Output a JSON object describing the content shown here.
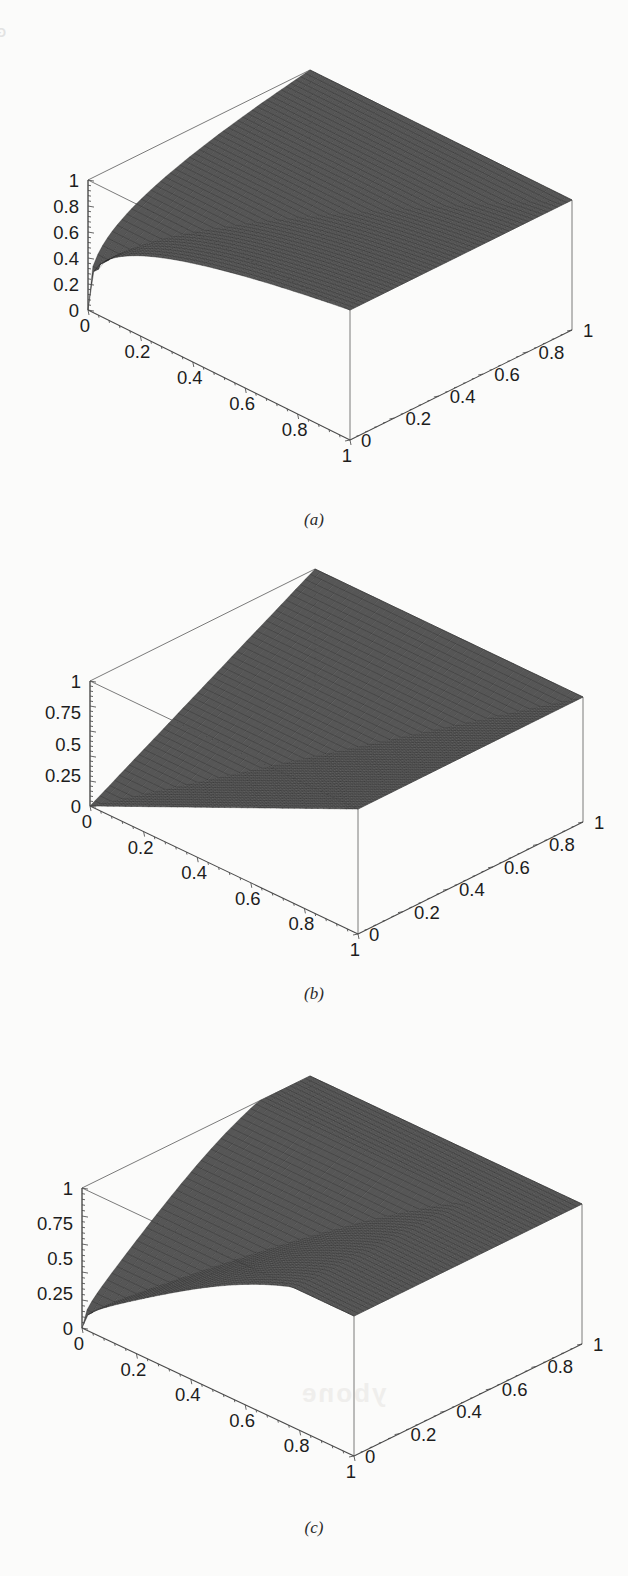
{
  "page": {
    "background_color": "#fbfbfa",
    "bleed_through_header": "GENERALIZED SHANNON ENTR",
    "bleed_through_fragment_mid": "ybone",
    "bleed_through_fragment_low": "ybone"
  },
  "figures": [
    {
      "id": "a",
      "caption": "(a)",
      "zaxis": {
        "label": "",
        "ticks": [
          "1",
          "0.8",
          "0.6",
          "0.4",
          "0.2",
          "0"
        ],
        "range": [
          0,
          1
        ]
      },
      "xaxis": {
        "label": "",
        "ticks": [
          "0",
          "0.2",
          "0.4",
          "0.6",
          "0.8",
          "1"
        ],
        "range": [
          0,
          1
        ]
      },
      "yaxis": {
        "label": "",
        "ticks": [
          "0",
          "0.2",
          "0.4",
          "0.6",
          "0.8",
          "1"
        ],
        "range": [
          0,
          1
        ]
      }
    },
    {
      "id": "b",
      "caption": "(b)",
      "zaxis": {
        "label": "",
        "ticks": [
          "1",
          "0.75",
          "0.5",
          "0.25",
          "0"
        ],
        "range": [
          0,
          1
        ]
      },
      "xaxis": {
        "label": "",
        "ticks": [
          "0",
          "0.2",
          "0.4",
          "0.6",
          "0.8",
          "1"
        ],
        "range": [
          0,
          1
        ]
      },
      "yaxis": {
        "label": "",
        "ticks": [
          "0",
          "0.2",
          "0.4",
          "0.6",
          "0.8",
          "1"
        ],
        "range": [
          0,
          1
        ]
      }
    },
    {
      "id": "c",
      "caption": "(c)",
      "zaxis": {
        "label": "",
        "ticks": [
          "1",
          "0.75",
          "0.5",
          "0.25",
          "0"
        ],
        "range": [
          0,
          1
        ]
      },
      "xaxis": {
        "label": "",
        "ticks": [
          "0",
          "0.2",
          "0.4",
          "0.6",
          "0.8",
          "1"
        ],
        "range": [
          0,
          1
        ]
      },
      "yaxis": {
        "label": "",
        "ticks": [
          "0",
          "0.2",
          "0.4",
          "0.6",
          "0.8",
          "1"
        ],
        "range": [
          0,
          1
        ]
      }
    }
  ],
  "chart_data": [
    {
      "type": "surface",
      "id": "a",
      "title": "",
      "xlabel": "",
      "ylabel": "",
      "zlabel": "",
      "xlim": [
        0,
        1
      ],
      "ylim": [
        0,
        1
      ],
      "zlim": [
        0,
        1
      ],
      "xticks": [
        0,
        0.2,
        0.4,
        0.6,
        0.8,
        1
      ],
      "yticks": [
        0,
        0.2,
        0.4,
        0.6,
        0.8,
        1
      ],
      "zticks": [
        0,
        0.2,
        0.4,
        0.6,
        0.8,
        1
      ],
      "grid": true,
      "legend": "none",
      "surface_formula": "z = max(x,y) ^ 0.25 style saturating ridge; high plateau near 1 over most of domain, dipping to 0 at the front corner (x=1,y=0)",
      "x": [
        0,
        0.25,
        0.5,
        0.75,
        1
      ],
      "y": [
        0,
        0.25,
        0.5,
        0.75,
        1
      ],
      "z": [
        [
          0.0,
          0.62,
          0.83,
          0.94,
          1.0
        ],
        [
          0.62,
          0.8,
          0.9,
          0.96,
          1.0
        ],
        [
          0.83,
          0.9,
          0.95,
          0.98,
          1.0
        ],
        [
          0.94,
          0.96,
          0.98,
          0.99,
          1.0
        ],
        [
          1.0,
          1.0,
          1.0,
          1.0,
          1.0
        ]
      ]
    },
    {
      "type": "surface",
      "id": "b",
      "title": "",
      "xlabel": "",
      "ylabel": "",
      "zlabel": "",
      "xlim": [
        0,
        1
      ],
      "ylim": [
        0,
        1
      ],
      "zlim": [
        0,
        1
      ],
      "xticks": [
        0,
        0.2,
        0.4,
        0.6,
        0.8,
        1
      ],
      "yticks": [
        0,
        0.2,
        0.4,
        0.6,
        0.8,
        1
      ],
      "zticks": [
        0,
        0.25,
        0.5,
        0.75,
        1
      ],
      "grid": true,
      "legend": "none",
      "surface_formula": "z = max(x,y) — planar ruled surface, flat triangular facets meeting along the diagonal x=y",
      "x": [
        0,
        0.25,
        0.5,
        0.75,
        1
      ],
      "y": [
        0,
        0.25,
        0.5,
        0.75,
        1
      ],
      "z": [
        [
          0.0,
          0.25,
          0.5,
          0.75,
          1.0
        ],
        [
          0.25,
          0.25,
          0.5,
          0.75,
          1.0
        ],
        [
          0.5,
          0.5,
          0.5,
          0.75,
          1.0
        ],
        [
          0.75,
          0.75,
          0.75,
          0.75,
          1.0
        ],
        [
          1.0,
          1.0,
          1.0,
          1.0,
          1.0
        ]
      ]
    },
    {
      "type": "surface",
      "id": "c",
      "title": "",
      "xlabel": "",
      "ylabel": "",
      "zlabel": "",
      "xlim": [
        0,
        1
      ],
      "ylim": [
        0,
        1
      ],
      "zlim": [
        0,
        1
      ],
      "xticks": [
        0,
        0.2,
        0.4,
        0.6,
        0.8,
        1
      ],
      "yticks": [
        0,
        0.2,
        0.4,
        0.6,
        0.8,
        1
      ],
      "zticks": [
        0,
        0.25,
        0.5,
        0.75,
        1
      ],
      "grid": true,
      "legend": "none",
      "surface_formula": "smooth dome rising from 0 at the origin corner to a broad rounded plateau near 1, falling toward the front (x=1,y=0) corner",
      "x": [
        0,
        0.25,
        0.5,
        0.75,
        1
      ],
      "y": [
        0,
        0.25,
        0.5,
        0.75,
        1
      ],
      "z": [
        [
          0.0,
          0.45,
          0.72,
          0.88,
          0.95
        ],
        [
          0.45,
          0.7,
          0.88,
          0.96,
          0.99
        ],
        [
          0.72,
          0.88,
          0.97,
          1.0,
          1.0
        ],
        [
          0.88,
          0.96,
          1.0,
          1.0,
          1.0
        ],
        [
          0.95,
          0.99,
          1.0,
          1.0,
          1.0
        ]
      ]
    }
  ]
}
